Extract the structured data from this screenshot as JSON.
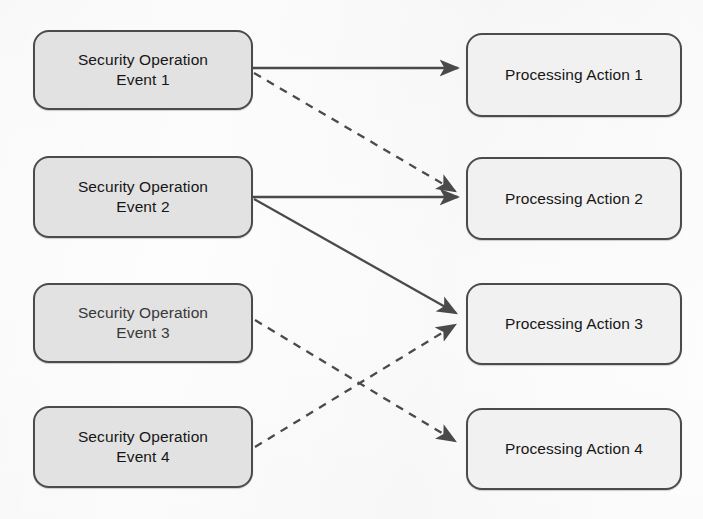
{
  "diagram": {
    "background_color": "#fdfdfd",
    "source_fill": "#e2e2e2",
    "target_fill": "#f1f1f1",
    "stroke_color": "#4b4b4b",
    "edge_color": "#4a4a4a",
    "sources": [
      {
        "id": "event-1",
        "label": "Security Operation\nEvent 1",
        "x": 33,
        "y": 30,
        "width": 220,
        "height": 80
      },
      {
        "id": "event-2",
        "label": "Security Operation\nEvent 2",
        "x": 33,
        "y": 156,
        "width": 220,
        "height": 82
      },
      {
        "id": "event-3",
        "label": "Security Operation\nEvent 3",
        "x": 33,
        "y": 283,
        "width": 220,
        "height": 80
      },
      {
        "id": "event-4",
        "label": "Security Operation\nEvent 4",
        "x": 33,
        "y": 406,
        "width": 220,
        "height": 82
      }
    ],
    "targets": [
      {
        "id": "action-1",
        "label": "Processing Action 1",
        "x": 466,
        "y": 33,
        "width": 216,
        "height": 84
      },
      {
        "id": "action-2",
        "label": "Processing Action 2",
        "x": 466,
        "y": 157,
        "width": 216,
        "height": 83
      },
      {
        "id": "action-3",
        "label": "Processing Action 3",
        "x": 466,
        "y": 283,
        "width": 216,
        "height": 82
      },
      {
        "id": "action-4",
        "label": "Processing Action 4",
        "x": 466,
        "y": 408,
        "width": 216,
        "height": 82
      }
    ],
    "edges": [
      {
        "id": "edge-e1-a1",
        "from": "event-1",
        "to": "action-1",
        "style": "solid",
        "x1": 253,
        "y1": 68,
        "x2": 464,
        "y2": 68
      },
      {
        "id": "edge-e1-a2",
        "from": "event-1",
        "to": "action-2",
        "style": "dashed",
        "x1": 254,
        "y1": 73,
        "x2": 462,
        "y2": 194
      },
      {
        "id": "edge-e2-a2",
        "from": "event-2",
        "to": "action-2",
        "style": "solid",
        "x1": 253,
        "y1": 197,
        "x2": 464,
        "y2": 197
      },
      {
        "id": "edge-e2-a3",
        "from": "event-2",
        "to": "action-3",
        "style": "solid",
        "x1": 254,
        "y1": 199,
        "x2": 462,
        "y2": 316
      },
      {
        "id": "edge-e3-a4",
        "from": "event-3",
        "to": "action-4",
        "style": "dashed",
        "x1": 255,
        "y1": 320,
        "x2": 462,
        "y2": 444
      },
      {
        "id": "edge-e4-a3",
        "from": "event-4",
        "to": "action-3",
        "style": "dashed",
        "x1": 255,
        "y1": 447,
        "x2": 462,
        "y2": 322
      }
    ],
    "edge_legend": {
      "solid_meaning": "solid arrow",
      "dashed_meaning": "dashed arrow"
    }
  }
}
